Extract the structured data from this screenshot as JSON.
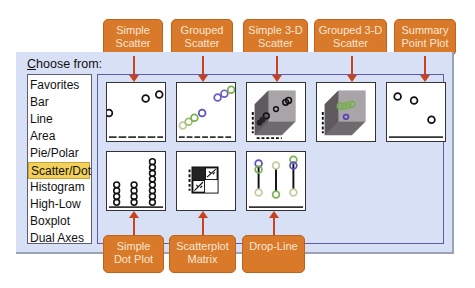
{
  "dialog": {
    "choose_from_prefix": "C",
    "choose_from_rest": "hoose from:"
  },
  "chart_types": [
    {
      "label": "Favorites",
      "selected": false
    },
    {
      "label": "Bar",
      "selected": false
    },
    {
      "label": "Line",
      "selected": false
    },
    {
      "label": "Area",
      "selected": false
    },
    {
      "label": "Pie/Polar",
      "selected": false
    },
    {
      "label": "Scatter/Dot",
      "selected": true
    },
    {
      "label": "Histogram",
      "selected": false
    },
    {
      "label": "High-Low",
      "selected": false
    },
    {
      "label": "Boxplot",
      "selected": false
    },
    {
      "label": "Dual Axes",
      "selected": false
    }
  ],
  "gallery": [
    {
      "name": "Simple Scatter",
      "icon": "simple-scatter-icon"
    },
    {
      "name": "Grouped Scatter",
      "icon": "grouped-scatter-icon"
    },
    {
      "name": "Simple 3-D Scatter",
      "icon": "simple-3d-scatter-icon"
    },
    {
      "name": "Grouped 3-D Scatter",
      "icon": "grouped-3d-scatter-icon"
    },
    {
      "name": "Summary Point Plot",
      "icon": "summary-point-plot-icon"
    },
    {
      "name": "Simple Dot Plot",
      "icon": "simple-dot-plot-icon"
    },
    {
      "name": "Scatterplot Matrix",
      "icon": "scatterplot-matrix-icon"
    },
    {
      "name": "Drop-Line",
      "icon": "drop-line-icon"
    }
  ],
  "callouts": {
    "simple_scatter": [
      "Simple",
      "Scatter"
    ],
    "grouped_scatter": [
      "Grouped",
      "Scatter"
    ],
    "simple_3d": [
      "Simple 3-D",
      "Scatter"
    ],
    "grouped_3d": [
      "Grouped 3-D",
      "Scatter"
    ],
    "summary_point": [
      "Summary",
      "Point Plot"
    ],
    "simple_dot": [
      "Simple",
      "Dot Plot"
    ],
    "scatter_matrix": [
      "Scatterplot",
      "Matrix"
    ],
    "drop_line": [
      "Drop-Line",
      ""
    ]
  },
  "colors": {
    "callout_bg": "#d9792a",
    "arrow": "#c9421e",
    "selected_bg": "#f2d15a",
    "panel_bg": "#d7e0f5"
  }
}
